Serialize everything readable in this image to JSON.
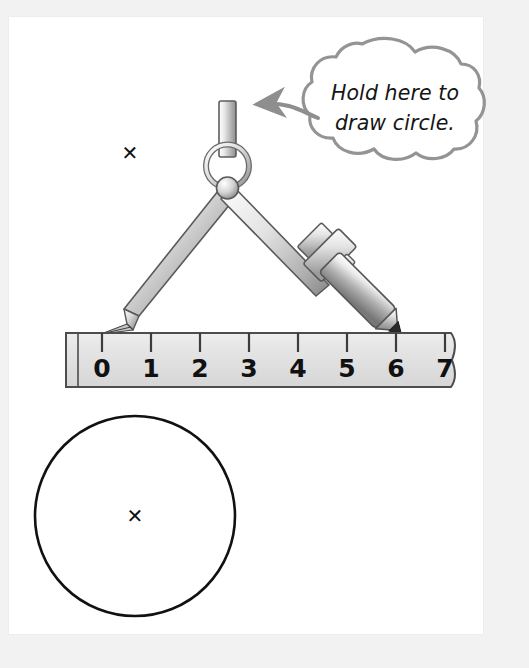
{
  "page": {
    "background_color": "#f2f2f2",
    "sheet_color": "#ffffff",
    "sheet_border_color": "#eceded"
  },
  "callout": {
    "name": "hold-here-callout",
    "line1": "Hold here to",
    "line2": "draw circle.",
    "outline_color": "#949494",
    "fill_color": "#ffffff",
    "arrow_color": "#8e8e8e"
  },
  "compass": {
    "name": "drawing-compass",
    "metal_light": "#f4f4f4",
    "metal_mid": "#c9c9c9",
    "metal_dark": "#7d7d7d",
    "outline_color": "#565656",
    "pencil_tip_color": "#2a2a2a",
    "left_leg_label": "needle-leg",
    "right_leg_label": "pencil-leg",
    "handle_label": "compass-handle",
    "ring_label": "compass-ring",
    "pivot_label": "compass-pivot"
  },
  "ruler": {
    "name": "ruler",
    "fill_color": "#e2e2e2",
    "outline_color": "#4d4d4d",
    "tick_color": "#3c3c3c",
    "marks": [
      "0",
      "1",
      "2",
      "3",
      "4",
      "5",
      "6",
      "7"
    ],
    "needle_at": "0",
    "pencil_at": "6"
  },
  "center_mark_top": {
    "name": "center-point-mark",
    "symbol": "✕"
  },
  "drawn_circle": {
    "name": "drawn-circle",
    "outline_color": "#111111",
    "center_symbol": "✕"
  }
}
